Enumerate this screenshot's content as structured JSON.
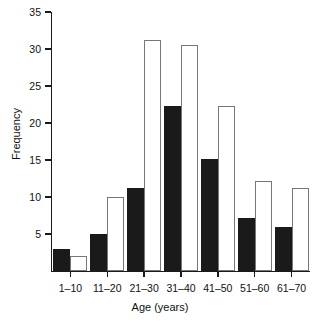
{
  "chart_data": {
    "type": "bar",
    "title": "",
    "xlabel": "Age (years)",
    "ylabel": "Frequency",
    "categories": [
      "1–10",
      "11–20",
      "21–30",
      "31–40",
      "41–50",
      "51–60",
      "61–70"
    ],
    "series": [
      {
        "name": "black",
        "color": "#1a1a1a",
        "values": [
          3,
          5,
          11.2,
          22.3,
          15.2,
          7.2,
          6
        ]
      },
      {
        "name": "white",
        "color": "#ffffff",
        "values": [
          2,
          10,
          31.2,
          30.6,
          22.3,
          12.2,
          11.2
        ]
      }
    ],
    "ylim": [
      0,
      35
    ],
    "yticks": [
      5,
      10,
      15,
      20,
      25,
      30,
      35
    ],
    "ytick_labels": [
      "5",
      "10",
      "15",
      "20",
      "25",
      "30",
      "35"
    ],
    "grid": false,
    "legend": false
  },
  "axes": {
    "x_title": "Age (years)",
    "y_title": "Frequency"
  }
}
